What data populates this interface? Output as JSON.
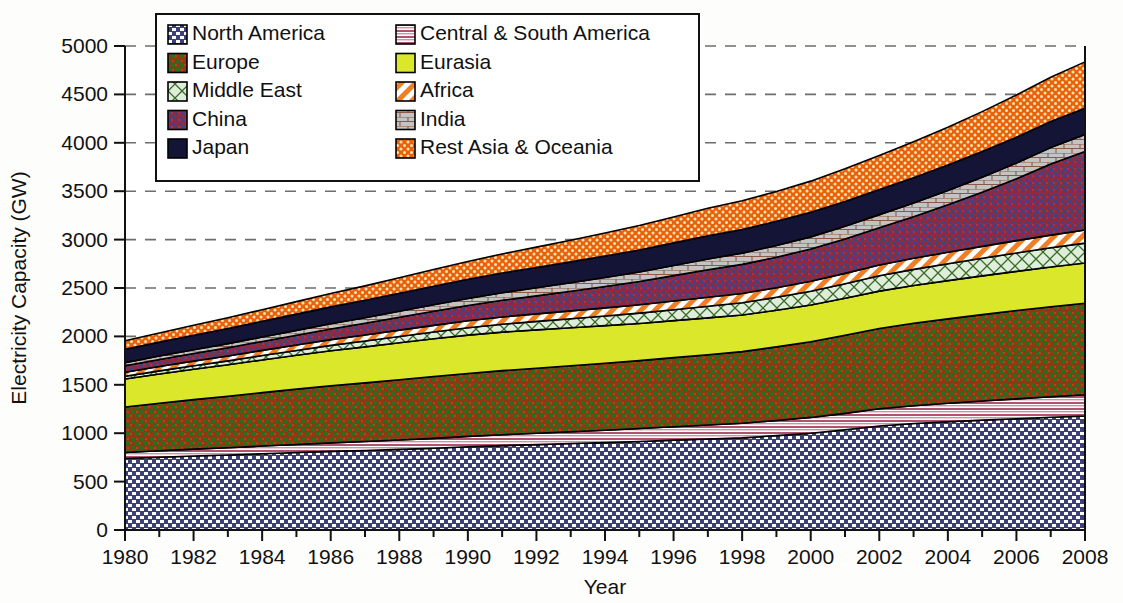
{
  "chart_data": {
    "type": "area",
    "title": "",
    "xlabel": "Year",
    "ylabel": "Electricity Capacity (GW)",
    "xlim": [
      1980,
      2008
    ],
    "ylim": [
      0,
      5000
    ],
    "ytick_step": 500,
    "xtick_step": 2,
    "minor_xtick_step": 1,
    "grid": "horizontal-dashed",
    "stacked": true,
    "legend_position": "top-left-inside",
    "yticks": [
      "0",
      "500",
      "1000",
      "1500",
      "2000",
      "2500",
      "3000",
      "3500",
      "4000",
      "4500",
      "5000"
    ],
    "xticks": [
      "1980",
      "1982",
      "1984",
      "1986",
      "1988",
      "1990",
      "1992",
      "1994",
      "1996",
      "1998",
      "2000",
      "2002",
      "2004",
      "2006",
      "2008"
    ],
    "x": [
      1980,
      1981,
      1982,
      1983,
      1984,
      1985,
      1986,
      1987,
      1988,
      1989,
      1990,
      1991,
      1992,
      1993,
      1994,
      1995,
      1996,
      1997,
      1998,
      1999,
      2000,
      2001,
      2002,
      2003,
      2004,
      2005,
      2006,
      2007,
      2008
    ],
    "series": [
      {
        "name": "North America",
        "pattern": "checker-dot",
        "color": "#3d3f7d",
        "pattern_color": "#ffffff",
        "values": [
          738,
          752,
          765,
          775,
          788,
          800,
          812,
          822,
          833,
          845,
          860,
          872,
          882,
          893,
          903,
          915,
          928,
          940,
          952,
          975,
          1000,
          1035,
          1075,
          1100,
          1118,
          1135,
          1150,
          1165,
          1178
        ]
      },
      {
        "name": "Central & South America",
        "pattern": "horizontal-stripe",
        "color": "#c2708a",
        "pattern_color": "#ffffff",
        "values": [
          62,
          66,
          70,
          74,
          79,
          83,
          88,
          92,
          97,
          102,
          107,
          112,
          117,
          122,
          128,
          133,
          139,
          145,
          151,
          157,
          163,
          170,
          177,
          184,
          191,
          198,
          205,
          212,
          220
        ]
      },
      {
        "name": "Europe",
        "pattern": "cross-weave",
        "color": "#8a3b12",
        "pattern_color": "#2e6b1f",
        "values": [
          470,
          492,
          512,
          532,
          552,
          572,
          590,
          606,
          622,
          638,
          650,
          662,
          672,
          682,
          692,
          702,
          714,
          726,
          740,
          760,
          782,
          806,
          830,
          852,
          872,
          892,
          912,
          930,
          945
        ]
      },
      {
        "name": "Eurasia",
        "pattern": "solid",
        "color": "#dbe72b",
        "pattern_color": "#dbe72b",
        "values": [
          290,
          302,
          314,
          326,
          338,
          350,
          362,
          372,
          382,
          390,
          396,
          398,
          396,
          392,
          388,
          384,
          382,
          380,
          378,
          378,
          380,
          383,
          386,
          390,
          395,
          400,
          405,
          410,
          415
        ]
      },
      {
        "name": "Middle East",
        "pattern": "diamond-lattice",
        "color": "#d9ead3",
        "pattern_color": "#3a6b28",
        "values": [
          28,
          32,
          36,
          40,
          45,
          50,
          55,
          60,
          65,
          70,
          76,
          82,
          88,
          94,
          100,
          106,
          113,
          120,
          127,
          134,
          142,
          150,
          158,
          166,
          174,
          182,
          190,
          198,
          206
        ]
      },
      {
        "name": "Africa",
        "pattern": "diagonal-stripe",
        "color": "#f5a96b",
        "pattern_color": "#ffffff",
        "values": [
          42,
          45,
          48,
          51,
          54,
          57,
          60,
          63,
          66,
          69,
          72,
          75,
          78,
          81,
          84,
          87,
          90,
          93,
          96,
          99,
          103,
          107,
          111,
          115,
          119,
          123,
          127,
          131,
          135
        ]
      },
      {
        "name": "China",
        "pattern": "dense-cross",
        "color": "#8e2b44",
        "pattern_color": "#3a3f8a",
        "values": [
          66,
          72,
          78,
          85,
          92,
          100,
          110,
          120,
          132,
          145,
          158,
          172,
          186,
          202,
          220,
          240,
          262,
          285,
          300,
          315,
          332,
          355,
          385,
          430,
          490,
          560,
          640,
          735,
          810
        ]
      },
      {
        "name": "India",
        "pattern": "brick",
        "color": "#b9b9b9",
        "pattern_color": "#7a4a3a",
        "values": [
          33,
          36,
          39,
          42,
          46,
          50,
          54,
          58,
          63,
          68,
          73,
          78,
          83,
          88,
          93,
          98,
          104,
          110,
          116,
          121,
          126,
          131,
          136,
          142,
          148,
          155,
          162,
          170,
          178
        ]
      },
      {
        "name": "Japan",
        "pattern": "solid",
        "color": "#141436",
        "pattern_color": "#141436",
        "values": [
          138,
          144,
          150,
          156,
          162,
          168,
          174,
          180,
          186,
          192,
          198,
          204,
          210,
          216,
          222,
          228,
          234,
          240,
          245,
          250,
          254,
          257,
          259,
          261,
          263,
          265,
          267,
          269,
          271
        ]
      },
      {
        "name": "Rest Asia & Oceania",
        "pattern": "dot-grid",
        "color": "#e8620c",
        "pattern_color": "#ffe9c2",
        "values": [
          88,
          95,
          103,
          111,
          120,
          129,
          139,
          149,
          160,
          172,
          184,
          197,
          210,
          224,
          238,
          253,
          268,
          284,
          296,
          308,
          322,
          337,
          352,
          370,
          390,
          412,
          435,
          458,
          478
        ]
      }
    ]
  },
  "legend": {
    "items": [
      {
        "label": "North America"
      },
      {
        "label": "Central & South America"
      },
      {
        "label": "Europe"
      },
      {
        "label": "Eurasia"
      },
      {
        "label": "Middle East"
      },
      {
        "label": "Africa"
      },
      {
        "label": "China"
      },
      {
        "label": "India"
      },
      {
        "label": "Japan"
      },
      {
        "label": "Rest Asia & Oceania"
      }
    ]
  }
}
